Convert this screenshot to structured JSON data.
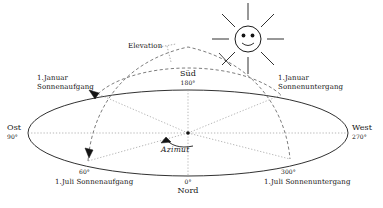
{
  "figure": {
    "colors": {
      "stroke": "#1a1a1a",
      "dotted": "#8a8a8a",
      "dashed": "#6e6e6e",
      "text": "#141414",
      "background": "#ffffff"
    }
  },
  "labels": {
    "elevation": "Elevation",
    "azimut": "Azimut",
    "cardinal": {
      "sued_name": "Süd",
      "sued_deg": "180°",
      "nord_name": "Nord",
      "nord_deg": "0°",
      "ost_name": "Ost",
      "ost_deg": "90°",
      "west_name": "West",
      "west_deg": "270°"
    },
    "events": {
      "jan_sunrise_line1": "1.Januar",
      "jan_sunrise_line2": "Sonnenaufgang",
      "jan_sunset_line1": "1.Januar",
      "jan_sunset_line2": "Sonnenuntergang",
      "jul_sunrise": "1.Juli Sonnenaufgang",
      "jul_sunrise_deg": "60°",
      "jul_sunset": "1.Juli Sonnenuntergang",
      "jul_sunset_deg": "300°"
    }
  },
  "icons": {
    "sun": "sun-smiley-icon",
    "sun_rays": 8
  },
  "geometry": {
    "horizon_center": [
      188,
      133
    ],
    "horizon_rx": 160,
    "horizon_ry": 43,
    "january_arc": "low winter sun path",
    "july_arc": "high summer sun path"
  }
}
